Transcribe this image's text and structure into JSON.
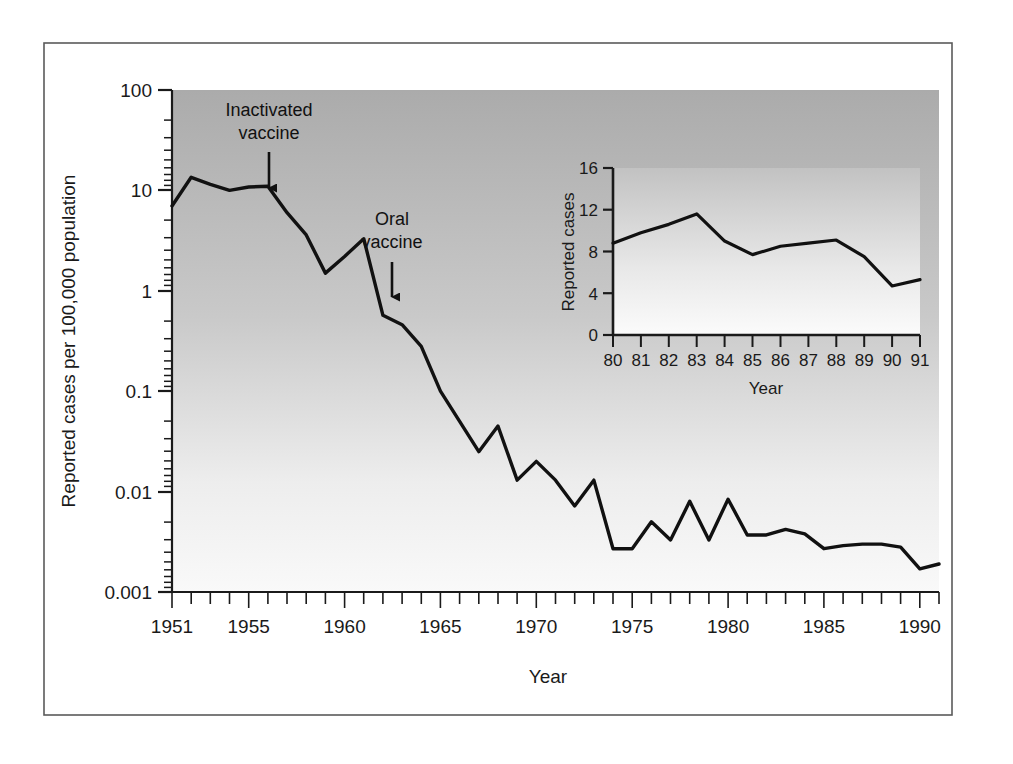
{
  "figure": {
    "border_color": "#4a4a4a",
    "plot_bg_top": "#ababab",
    "plot_bg_bottom": "#f7f7f7",
    "line_color": "#111111",
    "axis_color": "#1a1a1a"
  },
  "chart_data": {
    "type": "line",
    "title": "",
    "xlabel": "Year",
    "ylabel": "Reported cases per 100,000 population",
    "yscale": "log",
    "ylim": [
      0.001,
      100
    ],
    "xlim": [
      1951,
      1991
    ],
    "grid": false,
    "legend": null,
    "ytick_labels": [
      "100",
      "10",
      "1",
      "0.1",
      "0.01",
      "0.001"
    ],
    "ytick_values": [
      100,
      10,
      1,
      0.1,
      0.01,
      0.001
    ],
    "xtick_labels": [
      "1951",
      "1955",
      "1960",
      "1965",
      "1970",
      "1975",
      "1980",
      "1985",
      "1990"
    ],
    "xtick_values": [
      1951,
      1955,
      1960,
      1965,
      1970,
      1975,
      1980,
      1985,
      1990
    ],
    "x": [
      1951,
      1952,
      1953,
      1954,
      1955,
      1956,
      1957,
      1958,
      1959,
      1960,
      1961,
      1962,
      1963,
      1964,
      1965,
      1966,
      1967,
      1968,
      1969,
      1970,
      1971,
      1972,
      1973,
      1974,
      1975,
      1976,
      1977,
      1978,
      1979,
      1980,
      1981,
      1982,
      1983,
      1984,
      1985,
      1986,
      1987,
      1988,
      1989,
      1990,
      1991
    ],
    "values": [
      7.0,
      13.5,
      11.5,
      10.0,
      10.8,
      11.0,
      6.0,
      3.6,
      1.5,
      2.2,
      3.3,
      0.57,
      0.46,
      0.28,
      0.1,
      0.05,
      0.025,
      0.045,
      0.013,
      0.02,
      0.013,
      0.0072,
      0.013,
      0.0027,
      0.0027,
      0.005,
      0.0033,
      0.008,
      0.0033,
      0.0084,
      0.0037,
      0.0037,
      0.0042,
      0.0038,
      0.0027,
      0.0029,
      0.003,
      0.003,
      0.0028,
      0.0017,
      0.0019
    ],
    "annotations": [
      {
        "text_line1": "Inactivated",
        "text_line2": "vaccine",
        "points_to_year": 1956
      },
      {
        "text_line1": "Oral",
        "text_line2": "vaccine",
        "points_to_year": 1962
      }
    ]
  },
  "inset_chart_data": {
    "type": "line",
    "title": "",
    "xlabel": "Year",
    "ylabel": "Reported cases",
    "yscale": "linear",
    "ylim": [
      0,
      16
    ],
    "grid": false,
    "ytick_labels": [
      "0",
      "4",
      "8",
      "12",
      "16"
    ],
    "ytick_values": [
      0,
      4,
      8,
      12,
      16
    ],
    "xtick_labels": [
      "80",
      "81",
      "82",
      "83",
      "84",
      "85",
      "86",
      "87",
      "88",
      "89",
      "90",
      "91"
    ],
    "categories": [
      "80",
      "81",
      "82",
      "83",
      "84",
      "85",
      "86",
      "87",
      "88",
      "89",
      "90",
      "91"
    ],
    "values": [
      8.8,
      9.8,
      10.6,
      11.6,
      9.0,
      7.7,
      8.5,
      8.8,
      9.1,
      7.5,
      4.7,
      5.3
    ]
  }
}
